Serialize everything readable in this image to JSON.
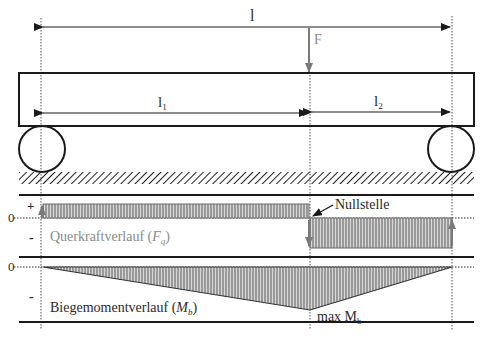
{
  "diagram": {
    "labels": {
      "total_length": "l",
      "force": "F",
      "length_1": "l",
      "length_1_sub": "1",
      "length_2": "l",
      "length_2_sub": "2",
      "plus_sign": "+",
      "minus_sign_shear": "-",
      "minus_sign_moment": "-",
      "zero_shear": "0",
      "zero_moment": "0",
      "zero_crossing": "Nullstelle",
      "shear_label": "Querkraftverlauf (",
      "shear_symbol": "F",
      "shear_symbol_sub": "q",
      "shear_label_end": ")",
      "moment_label": "Biegemomentverlauf (",
      "moment_symbol": "M",
      "moment_symbol_sub": "b",
      "moment_label_end": ")",
      "max_moment": "max M",
      "max_moment_sub": "b"
    },
    "colors": {
      "line": "#1a1a1a",
      "fill_hatch": "#8c8c8c",
      "grey_text": "#8a8a8a",
      "force_arrow": "#7a7a7a"
    }
  }
}
